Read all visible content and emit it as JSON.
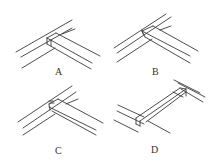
{
  "figure": {
    "type": "joint-construction-diagram",
    "panels": [
      {
        "id": "A",
        "label": "A",
        "description": "butt joint, crossbar meeting rail"
      },
      {
        "id": "B",
        "label": "B",
        "description": "housed joint with notch"
      },
      {
        "id": "C",
        "label": "C",
        "description": "dovetail/lap joint with notch"
      },
      {
        "id": "D",
        "label": "D",
        "description": "crossbar spanning two rails"
      }
    ]
  },
  "colors": {
    "line": "#3a3a3a",
    "background": "#ffffff",
    "label": "#333333"
  }
}
